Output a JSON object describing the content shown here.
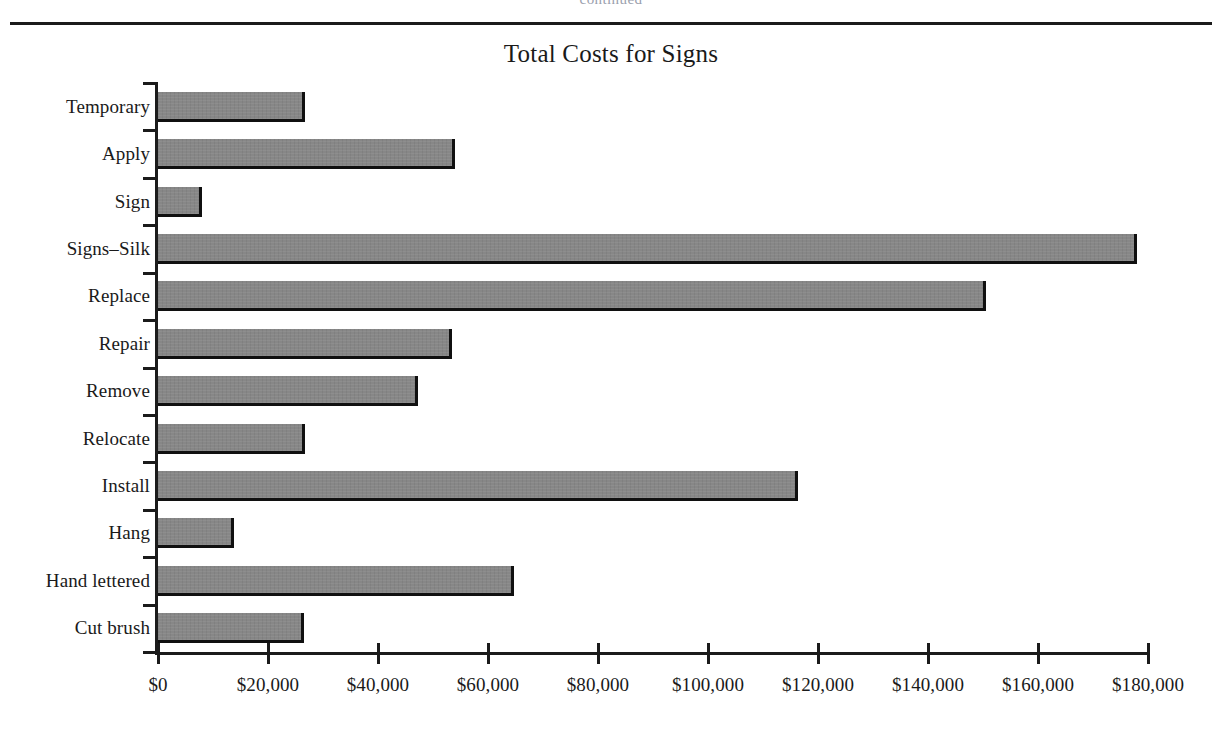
{
  "page": {
    "running_head": "continued"
  },
  "figure": {
    "title": "Total Costs for Signs"
  },
  "chart_data": {
    "type": "bar",
    "orientation": "horizontal",
    "title": "Total Costs for Signs",
    "xlabel": "",
    "ylabel": "",
    "xlim": [
      0,
      180000
    ],
    "grid": false,
    "legend": "none",
    "bar_color": "#878787",
    "bar_edge_color": "#101010",
    "axis_color": "#1b1b1b",
    "x_tick_labels": [
      "$0",
      "$20,000",
      "$40,000",
      "$60,000",
      "$80,000",
      "$100,000",
      "$120,000",
      "$140,000",
      "$160,000",
      "$180,000"
    ],
    "x_tick_values": [
      0,
      20000,
      40000,
      60000,
      80000,
      100000,
      120000,
      140000,
      160000,
      180000
    ],
    "categories": [
      "Temporary",
      "Apply",
      "Sign",
      "Signs–Silk",
      "Replace",
      "Repair",
      "Remove",
      "Relocate",
      "Install",
      "Hang",
      "Hand lettered",
      "Cut brush"
    ],
    "values": [
      26700,
      54000,
      8000,
      178000,
      150500,
      53400,
      47300,
      26700,
      116400,
      13800,
      64700,
      26500
    ]
  }
}
